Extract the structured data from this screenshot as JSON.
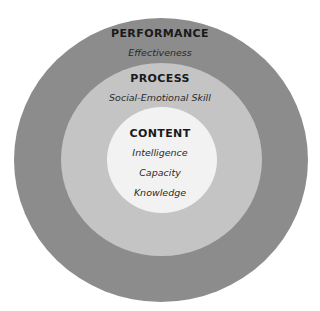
{
  "diagram": {
    "type": "concentric-circles",
    "colors": {
      "background": "#ffffff",
      "outer": "#8c8c8c",
      "middle": "#c4c4c4",
      "inner": "#f2f2f2",
      "text": "#1a1a1a"
    },
    "rings": [
      {
        "title": "PERFORMANCE",
        "items": [
          "Effectiveness"
        ]
      },
      {
        "title": "PROCESS",
        "items": [
          "Social-Emotional Skill"
        ]
      },
      {
        "title": "CONTENT",
        "items": [
          "Intelligence",
          "Capacity",
          "Knowledge"
        ]
      }
    ]
  }
}
